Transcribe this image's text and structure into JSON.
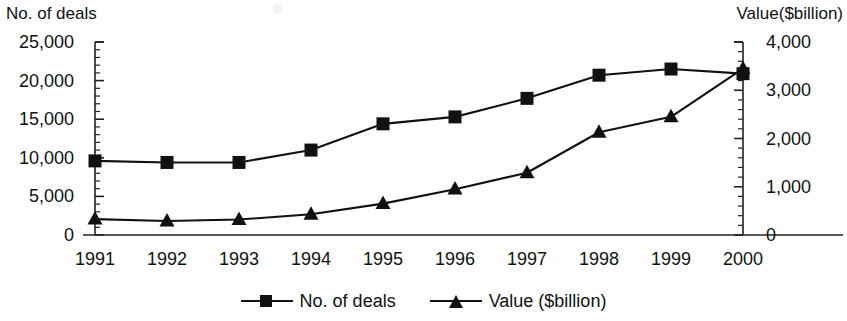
{
  "chart_data": {
    "type": "line",
    "title": "",
    "xlabel": "",
    "categories": [
      "1991",
      "1992",
      "1993",
      "1994",
      "1995",
      "1996",
      "1997",
      "1998",
      "1999",
      "2000"
    ],
    "grid": false,
    "legend_position": "bottom",
    "series": [
      {
        "name": "No. of deals",
        "axis": "left",
        "marker": "square",
        "color": "#111111",
        "values": [
          9600,
          9400,
          9400,
          11000,
          14400,
          15300,
          17700,
          20700,
          21500,
          20900
        ]
      },
      {
        "name": "Value ($billion)",
        "axis": "right",
        "marker": "triangle",
        "color": "#111111",
        "values": [
          330,
          290,
          320,
          430,
          650,
          950,
          1290,
          2130,
          2450,
          3450
        ]
      }
    ],
    "axes": {
      "left": {
        "label": "No. of deals",
        "min": 0,
        "max": 25000,
        "step": 5000,
        "ticks": [
          "0",
          "5,000",
          "10,000",
          "15,000",
          "20,000",
          "25,000"
        ],
        "minor_ticks": true
      },
      "right": {
        "label": "Value($billion)",
        "min": 0,
        "max": 4000,
        "step": 1000,
        "ticks": [
          "0",
          "1,000",
          "2,000",
          "3,000",
          "4,000"
        ],
        "minor_ticks": true
      }
    }
  },
  "legend": {
    "items": [
      {
        "label": "No. of deals"
      },
      {
        "label": "Value ($billion)"
      }
    ]
  }
}
